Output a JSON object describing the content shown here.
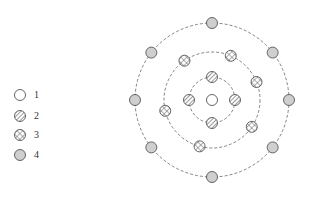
{
  "legend": {
    "items": [
      {
        "label": "1",
        "type": "empty",
        "y": 95
      },
      {
        "label": "2",
        "type": "hatched",
        "y": 116
      },
      {
        "label": "3",
        "type": "crosshatched",
        "y": 135
      },
      {
        "label": "4",
        "type": "gray",
        "y": 155
      }
    ]
  },
  "diagram": {
    "center": {
      "x": 212,
      "y": 100
    },
    "rings": [
      {
        "radius": 23,
        "node_type": "hatched",
        "angles_deg": [
          90,
          0,
          180,
          270
        ]
      },
      {
        "radius": 48,
        "node_type": "crosshatched",
        "angles_deg": [
          67,
          125,
          22,
          193,
          326,
          255
        ]
      },
      {
        "radius": 77,
        "node_type": "gray",
        "angles_deg": [
          90,
          38,
          142,
          0,
          180,
          218,
          322,
          270
        ]
      }
    ],
    "center_node_type": "empty",
    "colors": {
      "stroke": "#555555",
      "gray_fill": "#cfcfcf",
      "ring": "#666666"
    }
  }
}
